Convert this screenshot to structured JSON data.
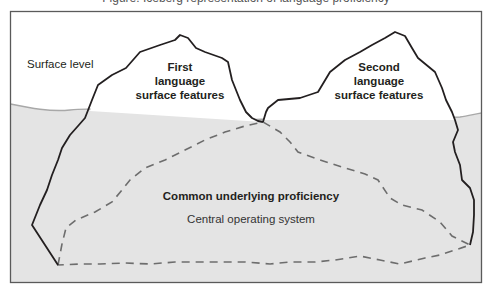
{
  "diagram": {
    "title_partial": "Figure: Iceberg representation of language proficiency",
    "surface_label": "Surface level",
    "first_language": {
      "line1": "First",
      "line2": "language",
      "line3": "surface features"
    },
    "second_language": {
      "line1": "Second",
      "line2": "language",
      "line3": "surface features"
    },
    "common_underlying": "Common underlying proficiency",
    "central_system": "Central operating system",
    "colors": {
      "water": "#e4e4e4",
      "water_line": "#a8a8a8",
      "outline": "#231f20",
      "dashed": "#6d6d6d",
      "frame": "#5a5a5a",
      "text": "#231f20"
    }
  }
}
